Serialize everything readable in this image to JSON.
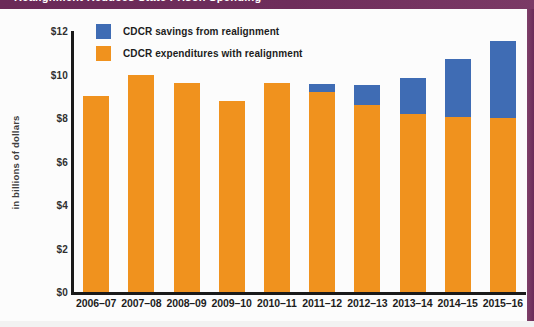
{
  "banner": {
    "text": "Realignment Reduces State Prison Spending"
  },
  "legend": {
    "position": "top-left-inside",
    "items": [
      {
        "label": "CDCR savings from realignment",
        "color": "#3f6cb4",
        "swatch_name": "legend-swatch-savings"
      },
      {
        "label": "CDCR expenditures with realignment",
        "color": "#f0921e",
        "swatch_name": "legend-swatch-expenditures"
      }
    ]
  },
  "colors": {
    "orange": "#f0921e",
    "blue": "#3f6cb4",
    "banner_purple": "#6b2a58",
    "axis": "#1a1a1a",
    "background": "#fcfcfc"
  },
  "chart_data": {
    "type": "bar",
    "title": "Realignment Reduces State Prison Spending",
    "subtitle": "",
    "xlabel": "",
    "ylabel": "in billions of dollars",
    "ylim": [
      0,
      12
    ],
    "yticks": [
      0,
      2,
      4,
      6,
      8,
      10,
      12
    ],
    "ytick_labels": [
      "$0",
      "$2",
      "$4",
      "$6",
      "$8",
      "$10",
      "$12"
    ],
    "grid": false,
    "stacked": true,
    "categories": [
      "2006–07",
      "2007–08",
      "2008–09",
      "2009–10",
      "2010–11",
      "2011–12",
      "2012–13",
      "2013–14",
      "2014–15",
      "2015–16"
    ],
    "series": [
      {
        "name": "CDCR expenditures with realignment",
        "color": "#f0921e",
        "values": [
          9.0,
          10.0,
          9.6,
          8.8,
          9.6,
          9.2,
          8.6,
          8.2,
          8.05,
          8.0
        ]
      },
      {
        "name": "CDCR savings from realignment",
        "color": "#3f6cb4",
        "values": [
          0,
          0,
          0,
          0,
          0,
          0.35,
          0.9,
          1.65,
          2.65,
          3.55
        ]
      }
    ],
    "totals": [
      9.0,
      10.0,
      9.6,
      8.8,
      9.6,
      9.55,
      9.5,
      9.85,
      10.7,
      11.55
    ]
  }
}
